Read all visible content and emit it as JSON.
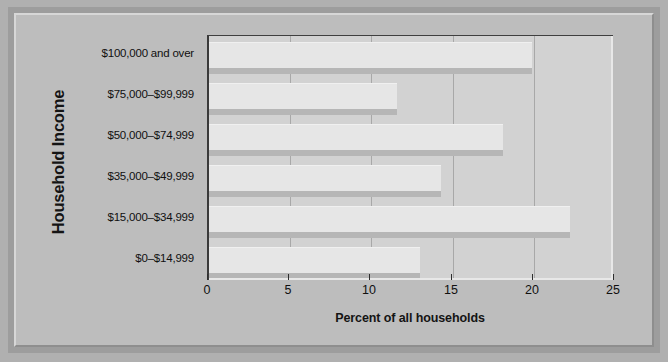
{
  "chart_data": {
    "type": "bar",
    "orientation": "horizontal",
    "title": "",
    "xlabel": "Percent of all households",
    "ylabel": "Household Income",
    "categories": [
      "$100,000 and over",
      "$75,000–$99,999",
      "$50,000–$74,999",
      "$35,000–$49,999",
      "$15,000–$34,999",
      "$0–$14,999"
    ],
    "values": [
      19.9,
      11.6,
      18.1,
      14.3,
      22.2,
      13.0
    ],
    "xlim": [
      0,
      25
    ],
    "xticks": [
      0,
      5,
      10,
      15,
      20,
      25
    ],
    "xtick_labels": [
      "0",
      "5",
      "10",
      "15",
      "20",
      "25"
    ],
    "grid": "vertical",
    "legend": "none",
    "bar_face_color": "#e6e6e6",
    "bar_shadow_color": "#b6b6b6",
    "plot_background": "#d2d2d2",
    "figure_background": "#bdbdbd",
    "mat_color": "#9d9d9d",
    "axis_color": "#3a3a3a",
    "text_color": "#101010"
  }
}
